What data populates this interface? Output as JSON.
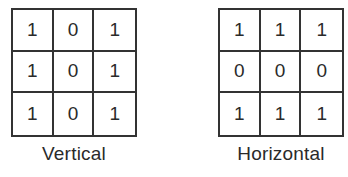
{
  "panels": [
    {
      "label": "Vertical",
      "matrix": [
        [
          "1",
          "0",
          "1"
        ],
        [
          "1",
          "0",
          "1"
        ],
        [
          "1",
          "0",
          "1"
        ]
      ]
    },
    {
      "label": "Horizontal",
      "matrix": [
        [
          "1",
          "1",
          "1"
        ],
        [
          "0",
          "0",
          "0"
        ],
        [
          "1",
          "1",
          "1"
        ]
      ]
    }
  ]
}
